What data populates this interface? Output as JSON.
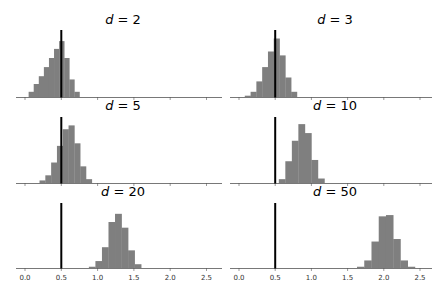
{
  "chart_data": [
    {
      "type": "bar",
      "subtype": "histogram",
      "title": "d = 2",
      "d": 2,
      "reference_line_x": 0.5,
      "xlim": [
        -0.12,
        2.65
      ],
      "xticks": [
        0.0,
        0.5,
        1.0,
        1.5,
        2.0,
        2.5
      ],
      "bins": [
        {
          "x0": 0.05,
          "x1": 0.12,
          "h": 0.08
        },
        {
          "x0": 0.12,
          "x1": 0.19,
          "h": 0.2
        },
        {
          "x0": 0.19,
          "x1": 0.26,
          "h": 0.32
        },
        {
          "x0": 0.26,
          "x1": 0.33,
          "h": 0.46
        },
        {
          "x0": 0.33,
          "x1": 0.4,
          "h": 0.6
        },
        {
          "x0": 0.4,
          "x1": 0.47,
          "h": 0.74
        },
        {
          "x0": 0.47,
          "x1": 0.54,
          "h": 0.86
        },
        {
          "x0": 0.54,
          "x1": 0.61,
          "h": 0.6
        },
        {
          "x0": 0.61,
          "x1": 0.68,
          "h": 0.27
        },
        {
          "x0": 0.68,
          "x1": 0.75,
          "h": 0.08
        }
      ]
    },
    {
      "type": "bar",
      "subtype": "histogram",
      "title": "d = 3",
      "d": 3,
      "reference_line_x": 0.5,
      "xlim": [
        -0.12,
        2.65
      ],
      "xticks": [
        0.0,
        0.5,
        1.0,
        1.5,
        2.0,
        2.5
      ],
      "bins": [
        {
          "x0": 0.08,
          "x1": 0.16,
          "h": 0.02
        },
        {
          "x0": 0.16,
          "x1": 0.24,
          "h": 0.08
        },
        {
          "x0": 0.24,
          "x1": 0.32,
          "h": 0.24
        },
        {
          "x0": 0.32,
          "x1": 0.4,
          "h": 0.46
        },
        {
          "x0": 0.4,
          "x1": 0.48,
          "h": 0.7
        },
        {
          "x0": 0.48,
          "x1": 0.56,
          "h": 0.9
        },
        {
          "x0": 0.56,
          "x1": 0.64,
          "h": 0.64
        },
        {
          "x0": 0.64,
          "x1": 0.72,
          "h": 0.3
        },
        {
          "x0": 0.72,
          "x1": 0.8,
          "h": 0.08
        }
      ]
    },
    {
      "type": "bar",
      "subtype": "histogram",
      "title": "d = 5",
      "d": 5,
      "reference_line_x": 0.5,
      "xlim": [
        -0.12,
        2.65
      ],
      "xticks": [
        0.0,
        0.5,
        1.0,
        1.5,
        2.0,
        2.5
      ],
      "bins": [
        {
          "x0": 0.2,
          "x1": 0.28,
          "h": 0.04
        },
        {
          "x0": 0.28,
          "x1": 0.36,
          "h": 0.12
        },
        {
          "x0": 0.36,
          "x1": 0.44,
          "h": 0.32
        },
        {
          "x0": 0.44,
          "x1": 0.52,
          "h": 0.58
        },
        {
          "x0": 0.52,
          "x1": 0.6,
          "h": 0.84
        },
        {
          "x0": 0.6,
          "x1": 0.68,
          "h": 0.9
        },
        {
          "x0": 0.68,
          "x1": 0.76,
          "h": 0.62
        },
        {
          "x0": 0.76,
          "x1": 0.84,
          "h": 0.26
        },
        {
          "x0": 0.84,
          "x1": 0.92,
          "h": 0.06
        }
      ]
    },
    {
      "type": "bar",
      "subtype": "histogram",
      "title": "d = 10",
      "d": 10,
      "reference_line_x": 0.5,
      "xlim": [
        -0.12,
        2.65
      ],
      "xticks": [
        0.0,
        0.5,
        1.0,
        1.5,
        2.0,
        2.5
      ],
      "bins": [
        {
          "x0": 0.55,
          "x1": 0.64,
          "h": 0.06
        },
        {
          "x0": 0.64,
          "x1": 0.73,
          "h": 0.34
        },
        {
          "x0": 0.73,
          "x1": 0.82,
          "h": 0.66
        },
        {
          "x0": 0.82,
          "x1": 0.91,
          "h": 0.92
        },
        {
          "x0": 0.91,
          "x1": 1.0,
          "h": 0.78
        },
        {
          "x0": 1.0,
          "x1": 1.09,
          "h": 0.36
        },
        {
          "x0": 1.09,
          "x1": 1.18,
          "h": 0.07
        }
      ]
    },
    {
      "type": "bar",
      "subtype": "histogram",
      "title": "d = 20",
      "d": 20,
      "reference_line_x": 0.5,
      "xlim": [
        -0.12,
        2.65
      ],
      "xticks": [
        0.0,
        0.5,
        1.0,
        1.5,
        2.0,
        2.5
      ],
      "xtick_labels": [
        "0.0",
        "0.5",
        "1.0",
        "1.5",
        "2.0",
        "2.5"
      ],
      "bins": [
        {
          "x0": 0.88,
          "x1": 0.97,
          "h": 0.02
        },
        {
          "x0": 0.97,
          "x1": 1.06,
          "h": 0.11
        },
        {
          "x0": 1.06,
          "x1": 1.15,
          "h": 0.33
        },
        {
          "x0": 1.15,
          "x1": 1.24,
          "h": 0.73
        },
        {
          "x0": 1.24,
          "x1": 1.33,
          "h": 0.86
        },
        {
          "x0": 1.33,
          "x1": 1.42,
          "h": 0.64
        },
        {
          "x0": 1.42,
          "x1": 1.51,
          "h": 0.28
        },
        {
          "x0": 1.51,
          "x1": 1.6,
          "h": 0.06
        }
      ]
    },
    {
      "type": "bar",
      "subtype": "histogram",
      "title": "d = 50",
      "d": 50,
      "reference_line_x": 0.5,
      "xlim": [
        -0.12,
        2.65
      ],
      "xticks": [
        0.0,
        0.5,
        1.0,
        1.5,
        2.0,
        2.5
      ],
      "xtick_labels": [
        "0.0",
        "0.5",
        "1.0",
        "1.5",
        "2.0",
        "2.5"
      ],
      "bins": [
        {
          "x0": 1.63,
          "x1": 1.73,
          "h": 0.02
        },
        {
          "x0": 1.73,
          "x1": 1.83,
          "h": 0.12
        },
        {
          "x0": 1.83,
          "x1": 1.93,
          "h": 0.42
        },
        {
          "x0": 1.93,
          "x1": 2.03,
          "h": 0.82
        },
        {
          "x0": 2.03,
          "x1": 2.13,
          "h": 0.84
        },
        {
          "x0": 2.13,
          "x1": 2.23,
          "h": 0.46
        },
        {
          "x0": 2.23,
          "x1": 2.33,
          "h": 0.12
        },
        {
          "x0": 2.33,
          "x1": 2.43,
          "h": 0.02
        }
      ]
    }
  ],
  "layout": {
    "rows": 3,
    "cols": 2,
    "bar_color": "#7f7f7f",
    "line_color": "#000000",
    "axis_color": "#555555"
  }
}
